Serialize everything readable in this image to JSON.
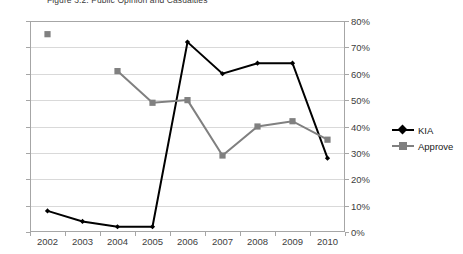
{
  "chart_data": {
    "type": "line",
    "title": "Figure 3.2: Public Opinion and Casualties",
    "xlabel": "",
    "ylabel": "",
    "categories": [
      "2002",
      "2003",
      "2004",
      "2005",
      "2006",
      "2007",
      "2008",
      "2009",
      "2010"
    ],
    "series": [
      {
        "name": "KIA",
        "axis": "left",
        "color": "#000000",
        "marker": "diamond",
        "values": [
          4,
          2,
          1,
          1,
          36,
          30,
          32,
          32,
          14
        ]
      },
      {
        "name": "Approve",
        "axis": "right",
        "color": "#808080",
        "marker": "square",
        "values": [
          75,
          null,
          61,
          49,
          50,
          29,
          40,
          42,
          35
        ]
      }
    ],
    "axes": {
      "left": {
        "label": "",
        "ylim": [
          0,
          40
        ],
        "ticks": [
          "40",
          "35",
          "30",
          "25",
          "20",
          "15",
          "10",
          "5",
          "0"
        ],
        "tick_values": [
          40,
          35,
          30,
          25,
          20,
          15,
          10,
          5,
          0
        ]
      },
      "right": {
        "label": "",
        "ylim": [
          0,
          80
        ],
        "ticks": [
          "80%",
          "70%",
          "60%",
          "50%",
          "40%",
          "30%",
          "20%",
          "10%",
          "0%"
        ],
        "tick_values": [
          80,
          70,
          60,
          50,
          40,
          30,
          20,
          10,
          0
        ]
      },
      "x": {
        "ticks": [
          "2002",
          "2003",
          "2004",
          "2005",
          "2006",
          "2007",
          "2008",
          "2009",
          "2010"
        ]
      }
    },
    "grid": true,
    "legend": {
      "position": "right",
      "entries": [
        {
          "label": "KIA",
          "color": "#000000",
          "marker": "diamond"
        },
        {
          "label": "Approve",
          "color": "#808080",
          "marker": "square"
        }
      ]
    },
    "colors": {
      "kia": "#000000",
      "approve": "#808080",
      "gridline": "#d9d9d9",
      "axis": "#a6a6a6",
      "text": "#404040"
    }
  }
}
